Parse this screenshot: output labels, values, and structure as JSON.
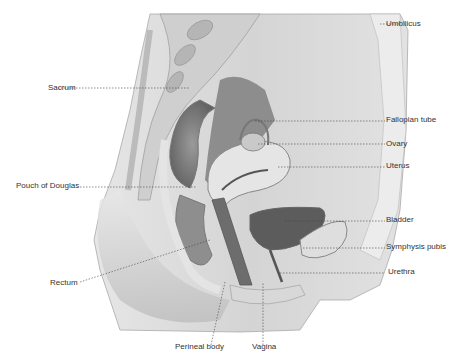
{
  "diagram": {
    "labels": {
      "umbilicus": "Umbilicus",
      "sacrum": "Sacrum",
      "fallopian_tube": "Fallopian tube",
      "ovary": "Ovary",
      "uterus": "Uterus",
      "pouch_of_douglas": "Pouch of Douglas",
      "bladder": "Bladder",
      "symphysis_pubis": "Symphysis pubis",
      "rectum": "Rectum",
      "urethra": "Urethra",
      "perineal_body": "Perineal body",
      "vagina": "Vagina"
    }
  }
}
